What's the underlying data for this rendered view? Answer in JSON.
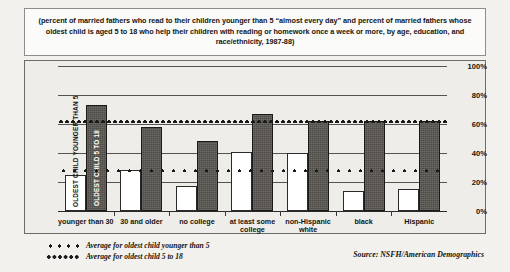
{
  "series_labels": {
    "young": "OLDEST CHILD YOUNGER THAN 5",
    "older": "OLDEST CHILD 5 TO 18"
  },
  "legend": [
    {
      "name": "avg-young",
      "label": "Average for oldest child younger than 5",
      "style": "young"
    },
    {
      "name": "avg-older",
      "label": "Average for oldest child 5 to 18",
      "style": "older"
    }
  ],
  "source": "Source: NSFH/American Demographics",
  "chart_data": {
    "type": "bar",
    "xlabel": "",
    "ylabel": "",
    "ylim": [
      0,
      100
    ],
    "yticks": [
      "0%",
      "20%",
      "40%",
      "60%",
      "80%",
      "100%"
    ],
    "ytick_values": [
      0,
      20,
      40,
      60,
      80,
      100
    ],
    "grid": true,
    "legend_position": "bottom-left",
    "categories": [
      "younger than 30",
      "30 and older",
      "no college",
      "at least some college",
      "non-Hispanic white",
      "black",
      "Hispanic"
    ],
    "series": [
      {
        "name": "OLDEST CHILD YOUNGER THAN 5",
        "fill": "white",
        "values": [
          25,
          28,
          17,
          41,
          40,
          14,
          15
        ]
      },
      {
        "name": "OLDEST CHILD 5 TO 18",
        "fill": "dark",
        "values": [
          73,
          58,
          48,
          67,
          62,
          62,
          62
        ]
      }
    ],
    "reference_lines": [
      {
        "name": "Average for oldest child younger than 5",
        "value": 28,
        "style": "coarse-dotted"
      },
      {
        "name": "Average for oldest child 5 to 18",
        "value": 62,
        "style": "fine-dotted"
      }
    ]
  }
}
